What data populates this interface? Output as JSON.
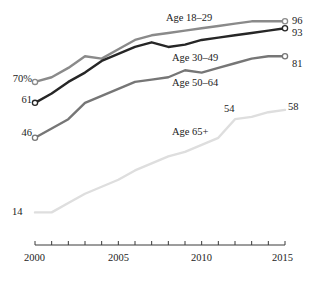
{
  "chart_data": {
    "type": "line",
    "title": "",
    "subtitle": "",
    "xlabel": "",
    "ylabel": "",
    "xlim": [
      2000,
      2015
    ],
    "ylim": [
      0,
      100
    ],
    "grid": false,
    "legend_position": "inline-labels",
    "x": [
      2000,
      2001,
      2002,
      2003,
      2004,
      2005,
      2006,
      2007,
      2008,
      2009,
      2010,
      2011,
      2012,
      2013,
      2014,
      2015
    ],
    "x_tick_labels": [
      "2000",
      "2005",
      "2010",
      "2015"
    ],
    "x_tick_values": [
      2000,
      2005,
      2010,
      2015
    ],
    "series": [
      {
        "name": "Age 18–29",
        "color": "#8a8a8a",
        "start_label": "70%",
        "end_label": "96",
        "start_value": 70,
        "end_value": 96,
        "values": [
          70,
          72,
          76,
          81,
          80,
          84,
          88,
          90,
          91,
          92,
          93,
          94,
          95,
          96,
          96,
          96
        ]
      },
      {
        "name": "Age 30–49",
        "color": "#262626",
        "start_label": "61",
        "end_label": "93",
        "start_value": 61,
        "end_value": 93,
        "values": [
          61,
          65,
          70,
          74,
          79,
          82,
          85,
          87,
          85,
          86,
          88,
          89,
          90,
          91,
          92,
          93
        ]
      },
      {
        "name": "Age 50–64",
        "color": "#767676",
        "start_label": "46",
        "end_label": "81",
        "start_value": 46,
        "end_value": 81,
        "values": [
          46,
          50,
          54,
          61,
          64,
          67,
          70,
          71,
          72,
          75,
          74,
          76,
          78,
          80,
          81,
          81
        ]
      },
      {
        "name": "Age 65+",
        "color": "#dedede",
        "start_label": "14",
        "end_label": "58",
        "mid_label": "54",
        "mid_label_x": 2012,
        "start_value": 14,
        "end_value": 58,
        "values": [
          14,
          14,
          18,
          22,
          25,
          28,
          32,
          35,
          38,
          40,
          43,
          46,
          54,
          55,
          57,
          58
        ]
      }
    ]
  },
  "series_labels": [
    {
      "text": "Age 18–29",
      "left": 166,
      "top": 13
    },
    {
      "text": "Age 30–49",
      "left": 172,
      "top": 53
    },
    {
      "text": "Age 50–64",
      "left": 172,
      "top": 78
    },
    {
      "text": "Age 65+",
      "left": 172,
      "top": 127
    }
  ],
  "value_labels": [
    {
      "text": "70%",
      "left": 4,
      "top": 74,
      "align": "left-side",
      "width": 28
    },
    {
      "text": "61",
      "left": 4,
      "top": 95,
      "align": "left-side",
      "width": 28
    },
    {
      "text": "46",
      "left": 4,
      "top": 128,
      "align": "left-side",
      "width": 28
    },
    {
      "text": "96",
      "left": 292,
      "top": 16,
      "align": "right-side",
      "width": 22
    },
    {
      "text": "93",
      "left": 292,
      "top": 28,
      "align": "right-side",
      "width": 22
    },
    {
      "text": "81",
      "left": 292,
      "top": 59,
      "align": "right-side",
      "width": 22
    },
    {
      "text": "54",
      "left": 224,
      "top": 104,
      "align": "free",
      "width": 22
    },
    {
      "text": "58",
      "left": 288,
      "top": 102,
      "align": "free",
      "width": 22
    },
    {
      "text": "14",
      "left": 12,
      "top": 207,
      "align": "free",
      "width": 22
    }
  ],
  "axis": {
    "ticks": [
      {
        "label": "2000",
        "left": 24,
        "top": 253
      },
      {
        "label": "2005",
        "left": 108,
        "top": 253
      },
      {
        "label": "2010",
        "left": 191,
        "top": 253
      },
      {
        "label": "2015",
        "left": 272,
        "top": 253
      }
    ]
  }
}
